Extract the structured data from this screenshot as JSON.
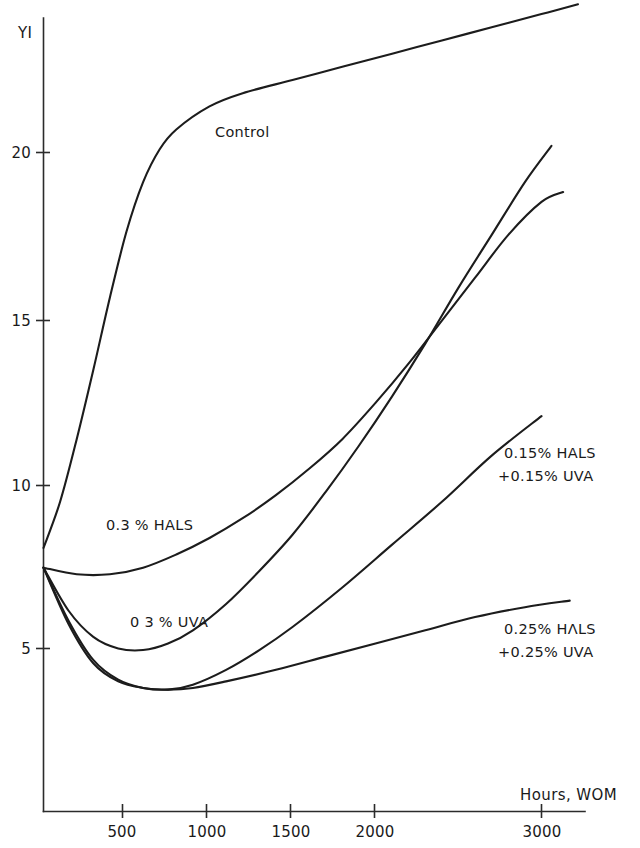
{
  "chart_data": {
    "type": "line",
    "title": "",
    "subtitle": "",
    "xlabel": "Hours, WOM",
    "ylabel": "YI",
    "xlim": [
      0,
      3250
    ],
    "ylim": [
      0,
      25.5
    ],
    "grid": false,
    "legend_position": "inline-annotations",
    "xticks": [
      500,
      1000,
      1500,
      2000,
      3000
    ],
    "xticklabels": [
      "500",
      "1000",
      "1500",
      "2000",
      "3000"
    ],
    "yticks": [
      5,
      10,
      15,
      20
    ],
    "yticklabels": [
      "5",
      "10",
      "15",
      "20"
    ],
    "series": [
      {
        "name": "Control",
        "label": "Control",
        "x": [
          0,
          100,
          200,
          300,
          400,
          500,
          600,
          700,
          800,
          1000,
          1200,
          1500,
          1800,
          2100,
          2400,
          2700,
          3000,
          3220
        ],
        "y": [
          8.0,
          9.4,
          11.3,
          13.4,
          15.6,
          17.6,
          19.1,
          20.1,
          20.7,
          21.4,
          21.8,
          22.2,
          22.6,
          23.0,
          23.4,
          23.8,
          24.2,
          24.5
        ]
      },
      {
        "name": "0.3% HALS",
        "label": "0.3 % HALS",
        "x": [
          0,
          200,
          400,
          600,
          800,
          1000,
          1200,
          1400,
          1600,
          1800,
          2000,
          2200,
          2400,
          2600,
          2800,
          3000,
          3130
        ],
        "y": [
          7.4,
          7.2,
          7.2,
          7.4,
          7.8,
          8.3,
          8.9,
          9.6,
          10.4,
          11.3,
          12.4,
          13.6,
          14.9,
          16.2,
          17.5,
          18.5,
          18.8
        ]
      },
      {
        "name": "0.3% UVA",
        "label": "0 3 % UVA",
        "x": [
          0,
          150,
          300,
          450,
          600,
          750,
          900,
          1100,
          1300,
          1500,
          1700,
          1900,
          2100,
          2300,
          2500,
          2700,
          2900,
          3060
        ],
        "y": [
          7.4,
          6.1,
          5.3,
          4.95,
          4.9,
          5.1,
          5.5,
          6.3,
          7.3,
          8.4,
          9.7,
          11.1,
          12.6,
          14.2,
          15.9,
          17.5,
          19.1,
          20.2
        ]
      },
      {
        "name": "0.15% HALS + 0.15% UVA",
        "label": "0.15% HALS",
        "label2": "+0.15% UVA",
        "x": [
          0,
          150,
          300,
          450,
          600,
          750,
          900,
          1100,
          1300,
          1500,
          1800,
          2100,
          2400,
          2700,
          3000
        ],
        "y": [
          7.4,
          5.8,
          4.6,
          4.0,
          3.75,
          3.7,
          3.85,
          4.3,
          4.9,
          5.6,
          6.8,
          8.1,
          9.4,
          10.8,
          12.0
        ]
      },
      {
        "name": "0.25% HALS + 0.25% UVA",
        "label": "0.25% HΛLS",
        "label2": "+0.25% UVA",
        "x": [
          0,
          150,
          300,
          450,
          600,
          750,
          900,
          1100,
          1400,
          1700,
          2000,
          2300,
          2600,
          2900,
          3170
        ],
        "y": [
          7.4,
          5.7,
          4.5,
          3.95,
          3.75,
          3.7,
          3.75,
          3.95,
          4.3,
          4.7,
          5.1,
          5.5,
          5.9,
          6.2,
          6.4
        ]
      }
    ],
    "annotations": [
      {
        "text": "Control",
        "x_px": 215,
        "y_px": 137
      },
      {
        "text": "0.3 % HALS",
        "x_px": 106,
        "y_px": 530
      },
      {
        "text": "0 3 % UVA",
        "x_px": 130,
        "y_px": 627
      },
      {
        "text": "0.15% HALS",
        "x_px": 504,
        "y_px": 458
      },
      {
        "text": "+0.15% UVA",
        "x_px": 498,
        "y_px": 481
      },
      {
        "text": "0.25% HΛLS",
        "x_px": 504,
        "y_px": 634
      },
      {
        "text": "+0.25% UVA",
        "x_px": 498,
        "y_px": 657
      }
    ],
    "colors": {
      "line": "#1c1c1c",
      "axis": "#2b2b2b",
      "background": "#ffffff",
      "text": "#1a1a1a"
    }
  },
  "axes": {
    "y_title": "YI",
    "x_title": "Hours, WOM"
  },
  "labels": {
    "control": "Control",
    "hals03": "0.3 % HALS",
    "uva03": "0 3 % UVA",
    "mix015_line1": "0.15% HALS",
    "mix015_line2": "+0.15% UVA",
    "mix025_line1": "0.25% HΛLS",
    "mix025_line2": "+0.25% UVA"
  },
  "yticklabels": {
    "t5": "5",
    "t10": "10",
    "t15": "15",
    "t20": "20"
  },
  "xticklabels": {
    "t500": "500",
    "t1000": "1000",
    "t1500": "1500",
    "t2000": "2000",
    "t3000": "3000"
  }
}
